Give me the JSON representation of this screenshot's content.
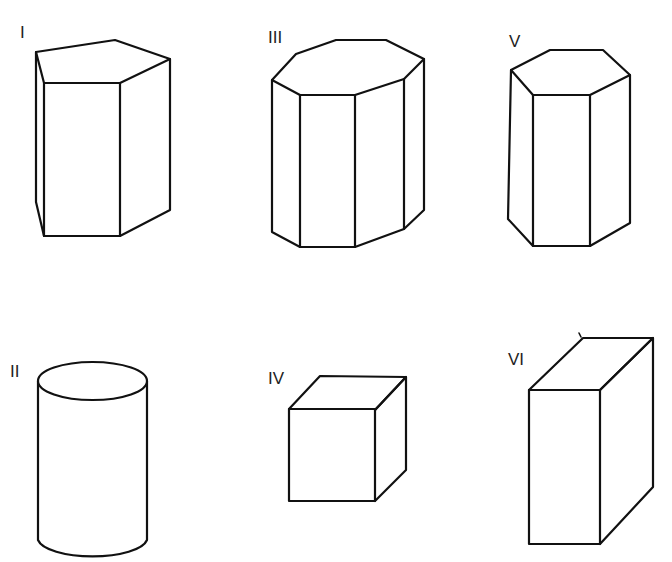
{
  "figure": {
    "colors": {
      "background": "#ffffff",
      "line": "#111111",
      "label": "#222222"
    },
    "solids": [
      {
        "id": "I",
        "label": "I",
        "shape": "pentagonal-prism"
      },
      {
        "id": "II",
        "label": "II",
        "shape": "cylinder"
      },
      {
        "id": "III",
        "label": "III",
        "shape": "octagonal-prism"
      },
      {
        "id": "IV",
        "label": "IV",
        "shape": "cube"
      },
      {
        "id": "V",
        "label": "V",
        "shape": "hexagonal-prism"
      },
      {
        "id": "VI",
        "label": "VI",
        "shape": "rectangular-prism"
      }
    ]
  }
}
